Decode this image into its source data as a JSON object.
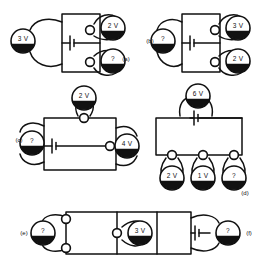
{
  "page": {
    "background_color": "#ffffff",
    "ink_color": "#111111"
  },
  "diagram": {
    "type": "circuit-worksheet",
    "circuits": [
      {
        "id": "a",
        "label": "(a)",
        "label_x": 126,
        "label_y": 59,
        "source": {
          "type": "battery",
          "x": 72,
          "y": 43
        },
        "meters": [
          {
            "name": "meter-a-left",
            "value": "3 V",
            "x": 23,
            "y": 41
          },
          {
            "name": "meter-a-top-right",
            "value": "2 V",
            "x": 113,
            "y": 28
          },
          {
            "name": "meter-a-bottom-right",
            "value": "?",
            "x": 113,
            "y": 61
          }
        ],
        "junctions": [
          {
            "x": 90,
            "y": 30
          },
          {
            "x": 90,
            "y": 62
          }
        ]
      },
      {
        "id": "b",
        "label": "(b)",
        "label_x": 150,
        "label_y": 41,
        "source": {
          "type": "battery",
          "x": 192,
          "y": 43
        },
        "meters": [
          {
            "name": "meter-b-left",
            "value": "?",
            "x": 163,
            "y": 41
          },
          {
            "name": "meter-b-top-right",
            "value": "3 V",
            "x": 238,
            "y": 28
          },
          {
            "name": "meter-b-bottom-right",
            "value": "2 V",
            "x": 238,
            "y": 61
          }
        ],
        "junctions": [
          {
            "x": 215,
            "y": 30
          },
          {
            "x": 215,
            "y": 62
          }
        ]
      },
      {
        "id": "c",
        "label": "(c)",
        "label_x": 19,
        "label_y": 140,
        "source": {
          "type": "battery",
          "x": 54,
          "y": 146
        },
        "meters": [
          {
            "name": "meter-c-top",
            "value": "2 V",
            "x": 84,
            "y": 98
          },
          {
            "name": "meter-c-left",
            "value": "?",
            "x": 32,
            "y": 143
          },
          {
            "name": "meter-c-right",
            "value": "4 V",
            "x": 127,
            "y": 146
          }
        ],
        "junctions": [
          {
            "x": 84,
            "y": 118
          },
          {
            "x": 110,
            "y": 146
          }
        ]
      },
      {
        "id": "d",
        "label": "(d)",
        "label_x": 245,
        "label_y": 193,
        "source": {
          "type": "battery",
          "x": 198,
          "y": 118
        },
        "meters": [
          {
            "name": "meter-d-top",
            "value": "6 V",
            "x": 198,
            "y": 96
          },
          {
            "name": "meter-d-bottom-left",
            "value": "2 V",
            "x": 172,
            "y": 178
          },
          {
            "name": "meter-d-bottom-middle",
            "value": "1 V",
            "x": 203,
            "y": 178
          },
          {
            "name": "meter-d-bottom-right",
            "value": "?",
            "x": 234,
            "y": 178
          }
        ],
        "junctions": [
          {
            "x": 172,
            "y": 155
          },
          {
            "x": 203,
            "y": 155
          },
          {
            "x": 234,
            "y": 155
          }
        ]
      },
      {
        "id": "e",
        "label": "(e)",
        "label_x": 24,
        "label_y": 233,
        "source": null,
        "meters": [
          {
            "name": "meter-e-left",
            "value": "?",
            "x": 43,
            "y": 233
          },
          {
            "name": "meter-e-middle",
            "value": "3 V",
            "x": 140,
            "y": 233
          }
        ],
        "junctions": [
          {
            "x": 66,
            "y": 219
          },
          {
            "x": 66,
            "y": 248
          },
          {
            "x": 117,
            "y": 233
          }
        ]
      },
      {
        "id": "f",
        "label": "(f)",
        "label_x": 249,
        "label_y": 233,
        "source": {
          "type": "battery",
          "x": 201,
          "y": 233
        },
        "meters": [
          {
            "name": "meter-f-right",
            "value": "?",
            "x": 228,
            "y": 233
          }
        ],
        "junctions": []
      }
    ],
    "all_meter_readings": [
      "3 V",
      "2 V",
      "?",
      "?",
      "3 V",
      "2 V",
      "2 V",
      "?",
      "4 V",
      "6 V",
      "2 V",
      "1 V",
      "?",
      "?",
      "3 V",
      "?"
    ],
    "unknown_symbol": "?",
    "panel_labels": [
      "(a)",
      "(b)",
      "(c)",
      "(d)",
      "(e)",
      "(f)"
    ]
  }
}
